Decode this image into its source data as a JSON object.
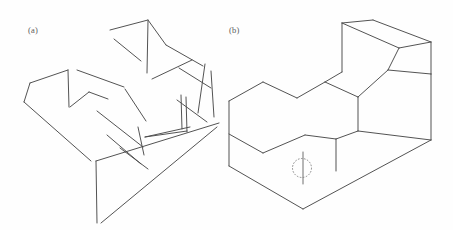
{
  "document": {
    "kind": "scanned-line-drawing-figure",
    "background_color": "#fefefe",
    "ink_color": "#4a4a4a",
    "width": 453,
    "height": 230
  },
  "panels": [
    {
      "id": "panel-a",
      "label": "(a)",
      "label_x": 28,
      "label_y": 33,
      "description": "fragmented exploded line drawing of an isometric block"
    },
    {
      "id": "panel-b",
      "label": "(b)",
      "label_x": 229,
      "label_y": 33,
      "description": "coherent isometric L-shaped block with dashed circle annotation"
    }
  ],
  "annotations": {
    "dashed_circle": {
      "name": "dashed-circle-marker",
      "cx": 302,
      "cy": 168,
      "r": 9.5,
      "stroke_color": "#7a7a7a",
      "dash": "1.6 1.5"
    }
  },
  "chart_data": {
    "type": "line",
    "title": "",
    "panel_a_strokes": [
      "M 110 30 L 148 20",
      "M 148 20 L 165 44",
      "M 148 20 L 147 72",
      "M 113 39 L 140 60",
      "M 152 78 L 190 60",
      "M 165 44 L 202 65",
      "M 204 63 L 197 112",
      "M 210 70 L 213 116",
      "M 179 67 L 210 87",
      "M 176 99 L 206 121",
      "M 180 94 L 182 128",
      "M 184 96 L 186 131",
      "M 30 82 L 68 70",
      "M 68 70 L 68 106",
      "M 30 82 L 24 101",
      "M 76 70 L 122 86",
      "M 70 106 L 88 92",
      "M 88 92 L 107 99",
      "M 24 101 L 90 160",
      "M 96 110 L 142 146",
      "M 124 88 L 145 120",
      "M 106 134 L 140 163",
      "M 137 126 L 143 154",
      "M 120 147 L 147 168",
      "M 144 136 L 189 126",
      "M 144 136 L 186 130",
      "M 96 160 L 97 222",
      "M 96 160 L 218 122",
      "M 100 222 L 216 126"
    ],
    "panel_b_strokes": [
      "M 229 101 L 263 82",
      "M 263 82 L 296 97",
      "M 296 97 L 325 81",
      "M 325 81 L 357 96",
      "M 325 81 L 343 71",
      "M 343 71 L 373 19",
      "M 341 22 L 373 19",
      "M 341 22 L 325 81",
      "M 373 19 L 430 41",
      "M 430 41 L 430 73",
      "M 430 41 L 387 69",
      "M 387 69 L 357 96",
      "M 357 96 L 357 130",
      "M 430 73 L 430 140",
      "M 357 130 L 430 140",
      "M 357 130 L 335 138",
      "M 335 138 L 335 170",
      "M 304 134 L 335 138",
      "M 304 134 L 263 152",
      "M 263 152 L 229 133",
      "M 229 101 L 229 165",
      "M 229 165 L 302 208",
      "M 302 208 L 430 140",
      "M 302 158 L 302 182",
      "M 263 82 L 263 82"
    ]
  }
}
